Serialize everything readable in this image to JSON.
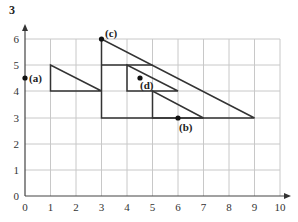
{
  "question_number": "3",
  "axes": {
    "x_ticks": [
      "0",
      "1",
      "2",
      "3",
      "4",
      "5",
      "6",
      "7",
      "8",
      "9",
      "10"
    ],
    "y_ticks": [
      "0",
      "1",
      "2",
      "3",
      "4",
      "5",
      "6"
    ],
    "xlim": [
      0,
      10
    ],
    "ylim": [
      0,
      6
    ]
  },
  "shapes": [
    {
      "name": "small-left-triangle",
      "points": [
        [
          1,
          5
        ],
        [
          1,
          4
        ],
        [
          3,
          4
        ]
      ]
    },
    {
      "name": "large-triangle",
      "points": [
        [
          3,
          6
        ],
        [
          3,
          3
        ],
        [
          9,
          3
        ]
      ]
    },
    {
      "name": "middle-triangle",
      "points": [
        [
          4,
          5
        ],
        [
          4,
          4
        ],
        [
          6,
          4
        ]
      ]
    },
    {
      "name": "lower-triangle",
      "points": [
        [
          5,
          4
        ],
        [
          5,
          3
        ],
        [
          7,
          3
        ]
      ]
    },
    {
      "name": "line-y5",
      "points": [
        [
          3,
          5
        ],
        [
          5,
          5
        ]
      ]
    }
  ],
  "points": [
    {
      "label": "(a)",
      "x": 0,
      "y": 4.5
    },
    {
      "label": "(b)",
      "x": 6,
      "y": 3
    },
    {
      "label": "(c)",
      "x": 3,
      "y": 6
    },
    {
      "label": "(d)",
      "x": 4.5,
      "y": 4.5
    }
  ],
  "colors": {
    "grid": "#c8c8c8",
    "line": "#333333",
    "axis": "#444444"
  }
}
